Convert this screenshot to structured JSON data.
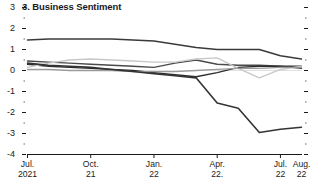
{
  "chart_data": {
    "type": "line",
    "title": "3. Business Sentiment",
    "xlabel": "",
    "ylabel": "",
    "ylim": [
      -4,
      3
    ],
    "yticks": [
      3,
      2,
      1,
      0,
      -1,
      -2,
      -3,
      -4
    ],
    "ytick_labels": [
      "3",
      "2",
      "1",
      "0",
      "-1",
      "-2",
      "-3",
      "-4"
    ],
    "grid": false,
    "legend": "none",
    "x": [
      "Jul. 2021",
      "Aug. 2021",
      "Sep. 2021",
      "Oct. 2021",
      "Nov. 2021",
      "Dec. 2021",
      "Jan. 2022",
      "Feb. 2022",
      "Mar. 2022",
      "Apr. 2022",
      "May 2022",
      "Jun. 2022",
      "Jul. 2022",
      "Aug. 2022"
    ],
    "xtick_labels": [
      {
        "l1": "Jul.",
        "l2": "2021"
      },
      {
        "l1": "Oct.",
        "l2": "21"
      },
      {
        "l1": "Jan.",
        "l2": "22"
      },
      {
        "l1": "Apr.",
        "l2": "22."
      },
      {
        "l1": "Jul.",
        "l2": "22"
      },
      {
        "l1": "Aug.",
        "l2": "22"
      }
    ],
    "series": [
      {
        "name": "series-1",
        "color": "#3a3a3a",
        "width": 1.5,
        "values": [
          1.45,
          1.5,
          1.5,
          1.5,
          1.5,
          1.45,
          1.4,
          1.25,
          1.1,
          1.0,
          1.0,
          1.0,
          0.7,
          0.55
        ]
      },
      {
        "name": "series-2",
        "color": "#4a4a4a",
        "width": 1.4,
        "values": [
          0.45,
          0.4,
          0.35,
          0.3,
          0.25,
          0.2,
          0.15,
          0.35,
          0.5,
          0.3,
          0.25,
          0.25,
          0.2,
          0.1
        ]
      },
      {
        "name": "series-3",
        "color": "#2e2e2e",
        "width": 1.4,
        "values": [
          0.3,
          0.2,
          0.15,
          0.1,
          0.05,
          0.0,
          -0.1,
          -0.2,
          -0.3,
          -0.1,
          0.15,
          0.2,
          0.2,
          0.2
        ]
      },
      {
        "name": "series-4",
        "color": "#c8c8c8",
        "width": 1.4,
        "values": [
          0.15,
          0.35,
          0.5,
          0.55,
          0.5,
          0.45,
          0.4,
          0.4,
          0.55,
          0.6,
          0.1,
          -0.35,
          0.05,
          0.2
        ]
      },
      {
        "name": "series-5",
        "color": "#9a9a9a",
        "width": 1.3,
        "values": [
          0.05,
          0.05,
          0.0,
          0.0,
          0.0,
          -0.05,
          -0.05,
          -0.05,
          0.0,
          0.05,
          0.1,
          0.1,
          0.15,
          0.15
        ]
      },
      {
        "name": "series-6",
        "color": "#333333",
        "width": 1.6,
        "values": [
          0.35,
          0.25,
          0.2,
          0.15,
          0.05,
          -0.05,
          -0.15,
          -0.25,
          -0.35,
          -1.55,
          -1.8,
          -2.95,
          -2.8,
          -2.7
        ]
      }
    ]
  }
}
